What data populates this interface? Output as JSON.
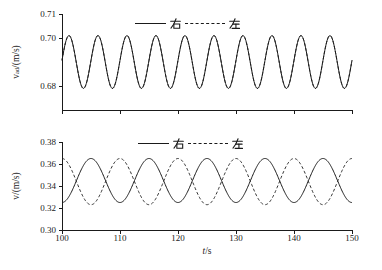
{
  "figure": {
    "background": "#ffffff",
    "line_color": "#1a1a1a"
  },
  "chart_data": [
    {
      "type": "line",
      "subplot": "top",
      "ylabel": {
        "base": "v",
        "sub": "ad",
        "rest": "/(m/s)"
      },
      "x_range": [
        100,
        150
      ],
      "y_range": [
        0.67,
        0.71
      ],
      "grid": false,
      "y_ticks": [
        {
          "value": 0.71,
          "label": "0.71"
        },
        {
          "value": 0.7,
          "label": "0.70"
        },
        {
          "value": 0.68,
          "label": "0.68"
        }
      ],
      "x_ticks": [
        100,
        110,
        120,
        130,
        140,
        150
      ],
      "x_tick_labels": [],
      "legend": {
        "position": "top-center",
        "entries": [
          {
            "label": "右",
            "line": "solid"
          },
          {
            "label": "左",
            "line": "dashed"
          }
        ]
      },
      "series": [
        {
          "name": "左",
          "line": "dashed",
          "waveform": {
            "mean": 0.69,
            "amplitude": 0.011,
            "period_s": 5,
            "peak_at_s": 101.2
          }
        },
        {
          "name": "右",
          "line": "solid",
          "waveform": {
            "mean": 0.69,
            "amplitude": 0.011,
            "period_s": 5,
            "peak_at_s": 101.2
          }
        }
      ]
    },
    {
      "type": "line",
      "subplot": "bottom",
      "ylabel": {
        "base": "v",
        "sub": "",
        "rest": "/(m/s)"
      },
      "xlabel": {
        "var": "t",
        "rest": "/s"
      },
      "x_range": [
        100,
        150
      ],
      "y_range": [
        0.3,
        0.38
      ],
      "grid": false,
      "y_ticks": [
        {
          "value": 0.38,
          "label": "0.38"
        },
        {
          "value": 0.36,
          "label": "0.36"
        },
        {
          "value": 0.34,
          "label": "0.34"
        },
        {
          "value": 0.32,
          "label": "0.32"
        },
        {
          "value": 0.3,
          "label": "0.30"
        }
      ],
      "x_ticks": [
        100,
        110,
        120,
        130,
        140,
        150
      ],
      "x_tick_labels": [
        "100",
        "110",
        "120",
        "130",
        "140",
        "150"
      ],
      "legend": {
        "position": "top-center",
        "entries": [
          {
            "label": "右",
            "line": "solid"
          },
          {
            "label": "左",
            "line": "dashed"
          }
        ]
      },
      "series": [
        {
          "name": "右",
          "line": "solid",
          "waveform": {
            "mean": 0.345,
            "amplitude": 0.02,
            "period_s": 10,
            "peak_at_s": 105
          }
        },
        {
          "name": "左",
          "line": "dashed",
          "waveform": {
            "mean": 0.344,
            "amplitude": 0.021,
            "period_s": 10,
            "peak_at_s": 100
          }
        }
      ]
    }
  ]
}
